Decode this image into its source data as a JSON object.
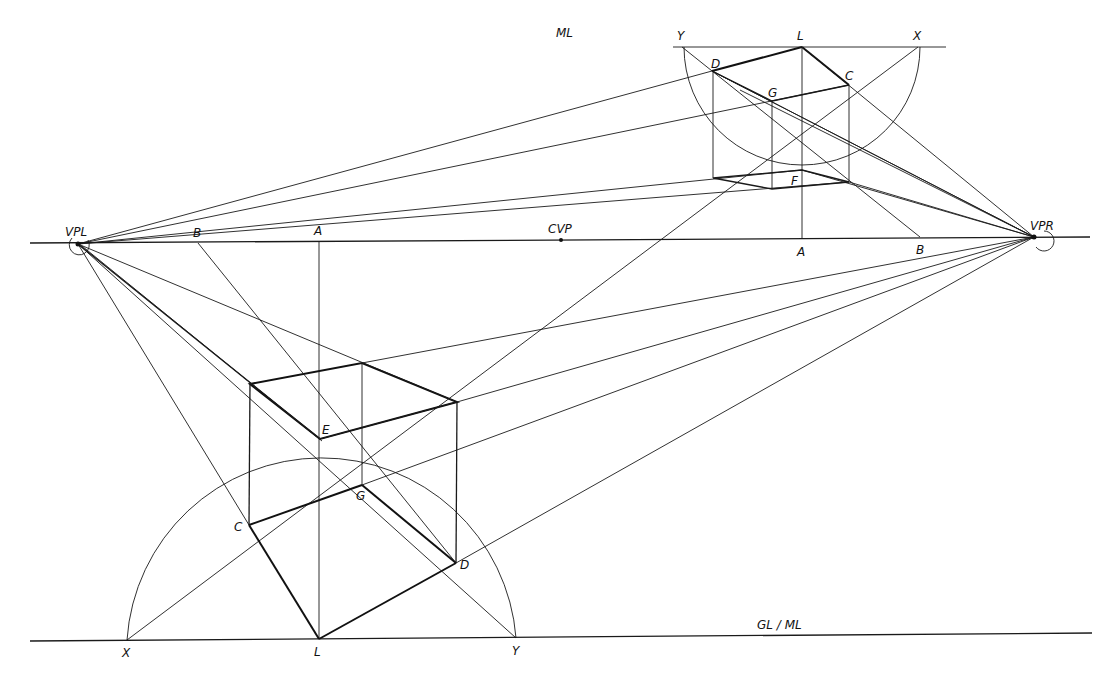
{
  "diagram": {
    "labels": {
      "vpl": "VPL",
      "vpr": "VPR",
      "cvp": "CVP",
      "horizon_b_left": "B",
      "horizon_a_left": "A",
      "horizon_a_right": "A",
      "horizon_b_right": "B",
      "top_ml": "ML",
      "top_y": "Y",
      "top_l": "L",
      "top_x": "X",
      "top_d": "D",
      "top_c": "C",
      "top_g": "G",
      "top_f": "F",
      "cube_e": "E",
      "cube_c": "C",
      "cube_g": "G",
      "cube_d": "D",
      "ground_x": "X",
      "ground_l": "L",
      "ground_y": "Y",
      "ground_label": "GL / ML"
    },
    "points": {
      "VPL": [
        78,
        244
      ],
      "VPR": [
        1034,
        237
      ],
      "CVP": [
        561,
        240
      ],
      "B_left": [
        198,
        243
      ],
      "A_left": [
        319,
        242
      ],
      "A_right": [
        802,
        238
      ],
      "B_right": [
        920,
        237
      ],
      "top_Y": [
        682,
        47
      ],
      "top_L": [
        802,
        47
      ],
      "top_X": [
        918,
        47
      ],
      "top_D": [
        712,
        71
      ],
      "top_C": [
        849,
        85
      ],
      "top_G": [
        772,
        101
      ],
      "top_F": [
        802,
        170
      ],
      "cube_E": [
        320,
        439
      ],
      "cube_C": [
        249,
        525
      ],
      "cube_G": [
        362,
        485
      ],
      "cube_D": [
        456,
        563
      ],
      "ground_X": [
        127,
        640
      ],
      "ground_L": [
        319,
        639
      ],
      "ground_Y": [
        516,
        638
      ]
    }
  }
}
